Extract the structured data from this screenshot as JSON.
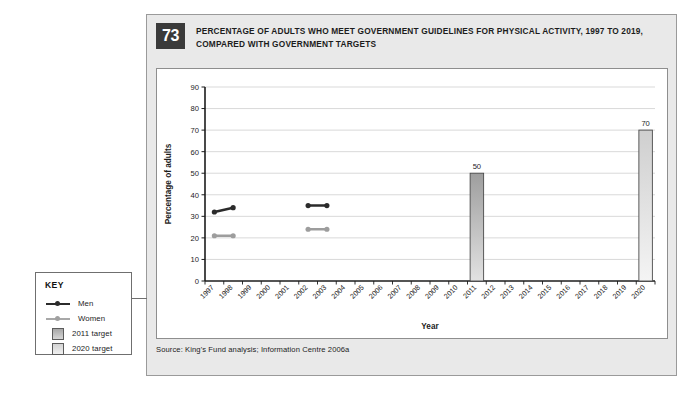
{
  "figure": {
    "number": "73",
    "title": "PERCENTAGE OF ADULTS WHO MEET GOVERNMENT GUIDELINES FOR PHYSICAL ACTIVITY, 1997 TO 2019, COMPARED WITH GOVERNMENT TARGETS",
    "source": "Source: King's Fund analysis; Information Centre 2006a"
  },
  "key": {
    "title": "KEY",
    "items": [
      {
        "label": "Men",
        "type": "line",
        "color": "#2b2b2b"
      },
      {
        "label": "Women",
        "type": "line",
        "color": "#9d9d9d"
      },
      {
        "label": "2011 target",
        "type": "box",
        "color": "#b4b4b4"
      },
      {
        "label": "2020 target",
        "type": "box",
        "color": "#dcdcdc"
      }
    ]
  },
  "chart_data": {
    "type": "line",
    "title": "PERCENTAGE OF ADULTS WHO MEET GOVERNMENT GUIDELINES FOR PHYSICAL ACTIVITY, 1997 TO 2019, COMPARED WITH GOVERNMENT TARGETS",
    "xlabel": "Year",
    "ylabel": "Percentage of adults",
    "ylim": [
      0,
      90
    ],
    "yticks": [
      0,
      10,
      20,
      30,
      40,
      50,
      60,
      70,
      80,
      90
    ],
    "grid": true,
    "legend_position": "outside-left",
    "categories": [
      "1997",
      "1998",
      "1999",
      "2000",
      "2001",
      "2002",
      "2003",
      "2004",
      "2005",
      "2006",
      "2007",
      "2008",
      "2009",
      "2010",
      "2011",
      "2012",
      "2013",
      "2014",
      "2015",
      "2016",
      "2017",
      "2018",
      "2019",
      "2020"
    ],
    "series": [
      {
        "name": "Men",
        "type": "line",
        "color": "#2b2b2b",
        "points": [
          {
            "x": "1997",
            "y": 32
          },
          {
            "x": "1998",
            "y": 34
          }
        ],
        "segments": [
          [
            {
              "x": "1997",
              "y": 32
            },
            {
              "x": "1998",
              "y": 34
            }
          ],
          [
            {
              "x": "2002",
              "y": 35
            },
            {
              "x": "2003",
              "y": 35
            }
          ]
        ]
      },
      {
        "name": "Women",
        "type": "line",
        "color": "#9d9d9d",
        "segments": [
          [
            {
              "x": "1997",
              "y": 21
            },
            {
              "x": "1998",
              "y": 21
            }
          ],
          [
            {
              "x": "2002",
              "y": 24
            },
            {
              "x": "2003",
              "y": 24
            }
          ]
        ]
      },
      {
        "name": "2011 target",
        "type": "bar",
        "color": "#b4b4b4",
        "bars": [
          {
            "x": "2011",
            "y": 50,
            "label": "50"
          }
        ]
      },
      {
        "name": "2020 target",
        "type": "bar",
        "color": "#dcdcdc",
        "bars": [
          {
            "x": "2020",
            "y": 70,
            "label": "70"
          }
        ]
      }
    ],
    "annotations": [
      {
        "text": "50",
        "x": "2011",
        "y": 50
      },
      {
        "text": "70",
        "x": "2020",
        "y": 70
      }
    ]
  }
}
